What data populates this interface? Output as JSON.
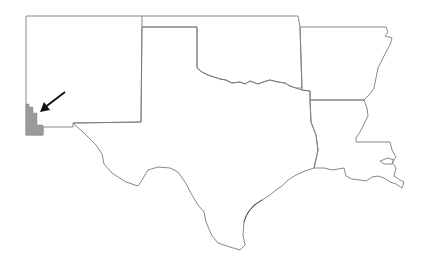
{
  "map": {
    "description": "Outline map of south-central United States",
    "states": [
      "New Mexico",
      "Texas",
      "Oklahoma",
      "Arkansas",
      "Louisiana"
    ],
    "highlight": {
      "label": "Highlighted county region (southwestern New Mexico)",
      "fill_color": "#9a9a9a"
    },
    "arrow": {
      "color": "#111111",
      "points_to": "highlighted region"
    },
    "colors": {
      "background": "#ffffff",
      "border": "#7a7a7a"
    }
  }
}
